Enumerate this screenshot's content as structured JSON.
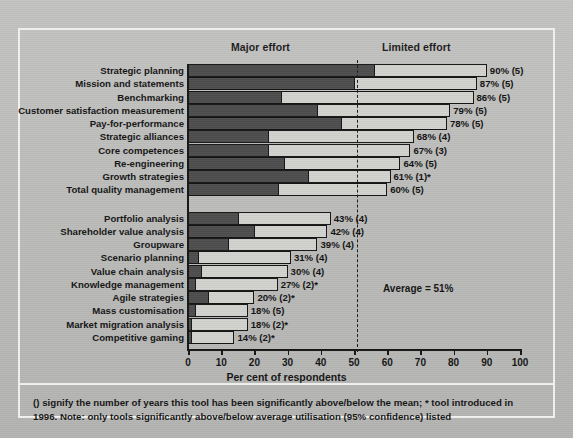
{
  "headers": {
    "major": "Major effort",
    "limited": "Limited effort"
  },
  "axis": {
    "xlabel": "Per cent of respondents",
    "ticks": [
      "0",
      "10",
      "20",
      "30",
      "40",
      "50",
      "60",
      "70",
      "80",
      "90",
      "100"
    ]
  },
  "average": {
    "label": "Average = 51%",
    "value": 51
  },
  "footnote": "() signify the number of years this tool has been significantly above/below the mean; * tool introduced in 1996. Note: only tools significantly above/below average utilisation (95% confidence) listed",
  "colors": {
    "major_effort_fill": "#4d4d4d",
    "limited_effort_fill": "#d2d2cf",
    "background": "#bdbdbb",
    "frame": "#f2f2ef",
    "ink": "#151515"
  },
  "chart_data": {
    "type": "bar",
    "orientation": "horizontal",
    "stacked": true,
    "title": "",
    "xlabel": "Per cent of respondents",
    "ylabel": "",
    "xlim": [
      0,
      100
    ],
    "grid": false,
    "legend_position": "top",
    "series": [
      {
        "name": "Major effort",
        "fill": "#4d4d4d"
      },
      {
        "name": "Limited effort",
        "fill": "#d2d2cf"
      }
    ],
    "categories": [
      "Strategic planning",
      "Mission and statements",
      "Benchmarking",
      "Customer satisfaction measurement",
      "Pay-for-performance",
      "Strategic alliances",
      "Core competences",
      "Re-engineering",
      "Growth strategies",
      "Total quality management",
      "Portfolio analysis",
      "Shareholder value analysis",
      "Groupware",
      "Scenario planning",
      "Value chain analysis",
      "Knowledge management",
      "Agile strategies",
      "Mass customisation",
      "Market migration analysis",
      "Competitive gaming"
    ],
    "values": [
      90,
      87,
      86,
      79,
      78,
      68,
      67,
      64,
      61,
      60,
      43,
      42,
      39,
      31,
      30,
      27,
      20,
      18,
      18,
      14
    ],
    "major_effort": [
      56,
      50,
      28,
      39,
      46,
      24,
      24,
      29,
      36,
      27,
      15,
      20,
      12,
      3,
      4,
      2,
      6,
      2,
      1,
      1
    ],
    "data_labels": [
      "90% (5)",
      "87% (5)",
      "86% (5)",
      "79% (5)",
      "78% (5)",
      "68% (4)",
      "67% (3)",
      "64% (5)",
      "61% (1)*",
      "60% (5)",
      "43%  (4)",
      "42% (4)",
      "39% (4)",
      "31% (4)",
      "30% (4)",
      "27% (2)*",
      "20% (2)*",
      "18% (5)",
      "18% (2)*",
      "14% (2)*"
    ],
    "group_break_after_index": 9,
    "annotations": [
      {
        "type": "vline",
        "value": 51,
        "label": "Average = 51%",
        "style": "dashed"
      }
    ]
  }
}
